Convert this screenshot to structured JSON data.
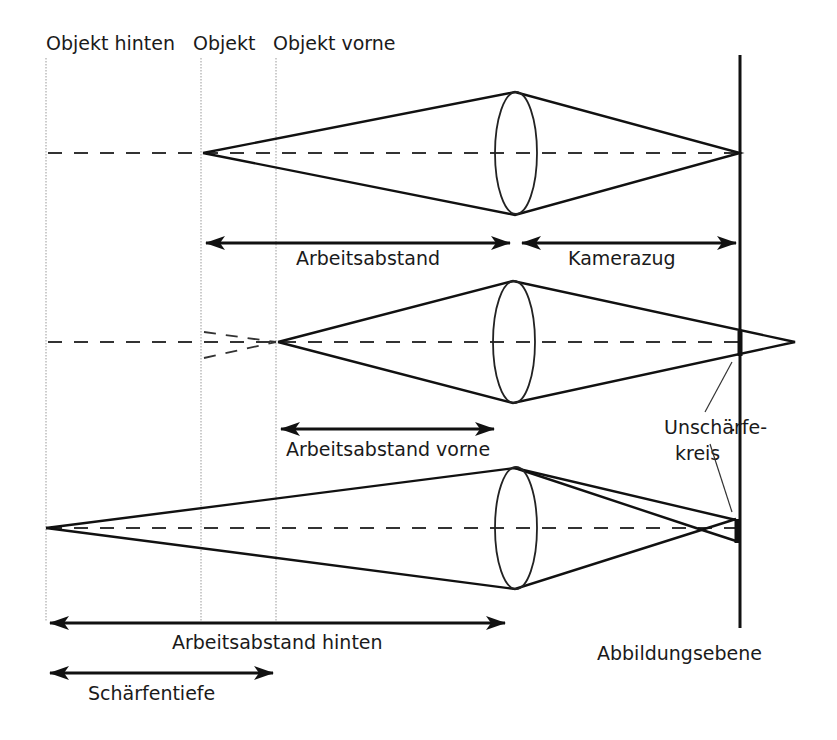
{
  "diagram": {
    "type": "optics-depth-of-field",
    "top_labels": {
      "object_back": "Objekt hinten",
      "object": "Objekt",
      "object_front": "Objekt vorne"
    },
    "dimension_labels": {
      "working_distance": "Arbeitsabstand",
      "camera_extension": "Kamerazug",
      "working_distance_front": "Arbeitsabstand vorne",
      "working_distance_back": "Arbeitsabstand hinten",
      "depth_of_field": "Schärfentiefe"
    },
    "callouts": {
      "blur_circle_line1": "Unschärfe-",
      "blur_circle_line2": "kreis",
      "image_plane": "Abbildungsebene"
    },
    "colors": {
      "line": "#111111",
      "guide": "#999999",
      "text": "#1a1a1a",
      "background": "#ffffff"
    }
  }
}
